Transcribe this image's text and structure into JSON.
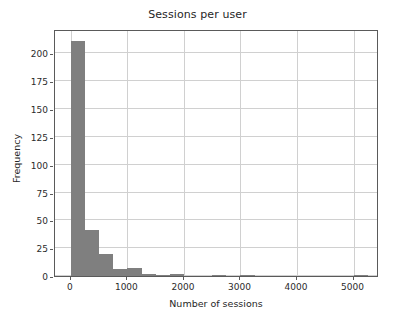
{
  "chart_data": {
    "type": "bar",
    "title": "Sessions per user",
    "xlabel": "Number of sessions",
    "ylabel": "Frequency",
    "grid": true,
    "legend": null,
    "bar_color": "#7f7f7f",
    "xlim": [
      -280,
      5450
    ],
    "ylim": [
      0,
      222
    ],
    "xticks": [
      0,
      1000,
      2000,
      3000,
      4000,
      5000
    ],
    "xtick_labels": [
      "0",
      "1000",
      "2000",
      "3000",
      "4000",
      "5000"
    ],
    "yticks": [
      0,
      25,
      50,
      75,
      100,
      125,
      150,
      175,
      200
    ],
    "ytick_labels": [
      "0",
      "25",
      "50",
      "75",
      "100",
      "125",
      "150",
      "175",
      "200"
    ],
    "bin_width": 250,
    "bin_starts": [
      0,
      250,
      500,
      750,
      1000,
      1250,
      1500,
      1750,
      2000,
      2250,
      2500,
      2750,
      3000,
      3250,
      3500,
      3750,
      4000,
      4250,
      4500,
      4750,
      5000
    ],
    "categories": [
      "0-250",
      "250-500",
      "500-750",
      "750-1000",
      "1000-1250",
      "1250-1500",
      "1500-1750",
      "1750-2000",
      "2000-2250",
      "2250-2500",
      "2500-2750",
      "2750-3000",
      "3000-3250",
      "3250-3500",
      "3500-3750",
      "3750-4000",
      "4000-4250",
      "4250-4500",
      "4500-4750",
      "4750-5000",
      "5000-5250"
    ],
    "values": [
      211,
      41,
      20,
      6,
      7,
      2,
      1,
      2,
      0,
      0,
      1,
      0,
      1,
      0,
      0,
      0,
      0,
      0,
      0,
      0,
      1
    ]
  }
}
